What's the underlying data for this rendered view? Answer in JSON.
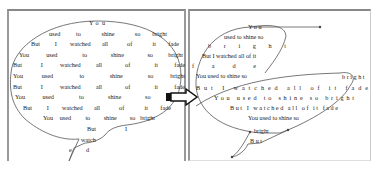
{
  "left_panel": {
    "label": "rectangular speech bubble text layout",
    "lines": [
      {
        "words": [
          "Y",
          "o",
          "u"
        ]
      },
      {
        "words": [
          "used",
          "to",
          "shine",
          "so",
          "bright"
        ]
      },
      {
        "words": [
          "But",
          "I",
          "watched",
          "all",
          "of",
          "it",
          "fade"
        ]
      },
      {
        "words": [
          "You",
          "used",
          "to",
          "shine",
          "so",
          "bright"
        ]
      },
      {
        "words": [
          "But",
          "I",
          "watched",
          "all",
          "of",
          "it",
          "fade"
        ]
      },
      {
        "words": [
          "You",
          "used",
          "to",
          "shine",
          "so",
          "bright"
        ]
      },
      {
        "words": [
          "But",
          "I",
          "watched",
          "all",
          "of",
          "it",
          "fade"
        ]
      },
      {
        "words": [
          "You",
          "used",
          "to",
          "shine",
          "so",
          "bright"
        ]
      },
      {
        "words": [
          "But",
          "I",
          "watched",
          "all",
          "of",
          "it",
          "fade"
        ]
      },
      {
        "words": [
          "You",
          "used",
          "to",
          "shine",
          "so",
          "bright"
        ]
      },
      {
        "words": [
          "But",
          "I"
        ]
      },
      {
        "words": [
          "watch"
        ]
      },
      {
        "words": [
          "e",
          "d"
        ]
      }
    ]
  },
  "arrow": {
    "direction": "right",
    "label": "transform arrow"
  },
  "right_panel": {
    "label": "deformed speech bubble text layout",
    "lines": [
      "Y o u",
      "used to shine so",
      "b r i g h t",
      "But I watched all of it",
      "f a d e",
      "You used to shine so",
      "b r i g h t",
      "But I watched all of it fade",
      "You used to shine so bright",
      "But I watched all of it fade",
      "You used to shine so",
      "bright",
      "B u t"
    ]
  },
  "colors": {
    "outline": "#555555",
    "border": "#999999",
    "text": "#222222"
  }
}
